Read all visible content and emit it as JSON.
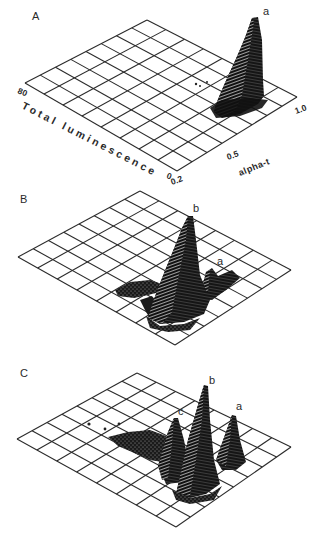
{
  "figure": {
    "panels": [
      {
        "id": "A",
        "label": "A"
      },
      {
        "id": "B",
        "label": "B"
      },
      {
        "id": "C",
        "label": "C"
      }
    ],
    "axes": {
      "luminescence_title": "Total luminescence",
      "luminescence_max_tick": "80",
      "luminescence_min_tick": "0",
      "alpha_title": "alpha-t",
      "alpha_ticks": [
        "0.2",
        "0.5",
        "1.0"
      ]
    },
    "colors": {
      "grid": "#2b2b2b",
      "surface": "#111111",
      "mesh_highlight": "#e8e8e8",
      "background": "#ffffff"
    }
  },
  "chart_data": [
    {
      "type": "surface3d",
      "title": "A",
      "xlabel": "alpha-t",
      "ylabel": "Total luminescence",
      "x_ticks": [
        "0.2",
        "0.5",
        "1.0"
      ],
      "y_ticks": [
        "0",
        "80"
      ],
      "xlim": [
        0.2,
        1.0
      ],
      "ylim": [
        0,
        80
      ],
      "grid": "8x8",
      "peaks": [
        {
          "name": "a",
          "alpha_t": 0.9,
          "total_luminescence": 20,
          "relative_height": 1.0
        }
      ]
    },
    {
      "type": "surface3d",
      "title": "B",
      "xlabel": "alpha-t",
      "ylabel": "Total luminescence",
      "xlim": [
        0.2,
        1.0
      ],
      "ylim": [
        0,
        80
      ],
      "grid": "8x8",
      "peaks": [
        {
          "name": "b",
          "alpha_t": 0.6,
          "total_luminescence": 25,
          "relative_height": 1.0
        },
        {
          "name": "a",
          "alpha_t": 0.9,
          "total_luminescence": 20,
          "relative_height": 0.25
        }
      ]
    },
    {
      "type": "surface3d",
      "title": "C",
      "xlabel": "alpha-t",
      "ylabel": "Total luminescence",
      "xlim": [
        0.2,
        1.0
      ],
      "ylim": [
        0,
        80
      ],
      "grid": "8x8",
      "peaks": [
        {
          "name": "c",
          "alpha_t": 0.45,
          "total_luminescence": 30,
          "relative_height": 0.6
        },
        {
          "name": "b",
          "alpha_t": 0.6,
          "total_luminescence": 25,
          "relative_height": 1.0
        },
        {
          "name": "a",
          "alpha_t": 0.9,
          "total_luminescence": 20,
          "relative_height": 0.6
        }
      ]
    }
  ]
}
